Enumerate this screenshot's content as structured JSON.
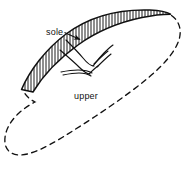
{
  "figure": {
    "kind": "technical-line-drawing",
    "width": 192,
    "height": 174,
    "background_color": "#ffffff",
    "ink_color": "#111111",
    "labels": {
      "sole": "sole",
      "upper": "upper"
    },
    "parts": [
      {
        "name": "sole",
        "rendering": "hatched crescent band",
        "hatch": "vertical parallel lines",
        "outline": "solid"
      },
      {
        "name": "upper",
        "rendering": "large tilted closed loop",
        "outline": "dashed"
      },
      {
        "name": "stitching-threads",
        "rendering": "thin curved double lines crossing the sole band",
        "outline": "solid"
      }
    ],
    "leader_lines": [
      {
        "label": "sole",
        "from": "label text right edge",
        "to": "hatched sole band",
        "style": "solid with arrow"
      }
    ]
  }
}
